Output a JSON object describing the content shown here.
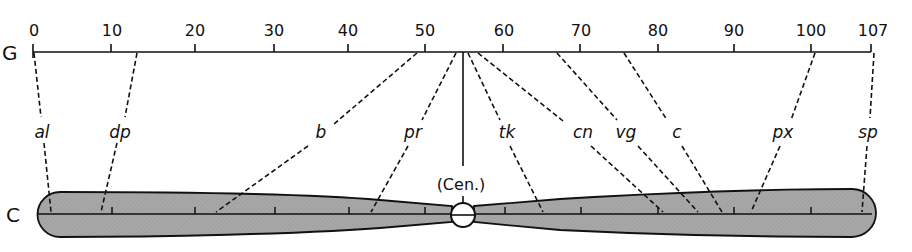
{
  "diagram": {
    "type": "genetic-vs-cytological-map",
    "genetic_map": {
      "label": "G",
      "range": [
        0,
        107
      ],
      "tick_labels": [
        "0",
        "10",
        "20",
        "30",
        "40",
        "50",
        "60",
        "70",
        "80",
        "90",
        "100",
        "107"
      ],
      "tick_values": [
        0,
        10,
        20,
        30,
        40,
        50,
        60,
        70,
        80,
        90,
        100,
        107
      ]
    },
    "chromosome": {
      "label": "C",
      "centromere_label": "(Cen.)",
      "fill_color": "#a9a9a9",
      "outline_color": "#111111"
    },
    "genes": [
      {
        "symbol": "al",
        "genetic_position": 0
      },
      {
        "symbol": "dp",
        "genetic_position": 13
      },
      {
        "symbol": "b",
        "genetic_position": 48.5
      },
      {
        "symbol": "pr",
        "genetic_position": 54.5
      },
      {
        "symbol": "tk",
        "genetic_position": 55.9
      },
      {
        "symbol": "cn",
        "genetic_position": 57.5
      },
      {
        "symbol": "vg",
        "genetic_position": 67
      },
      {
        "symbol": "c",
        "genetic_position": 75.5
      },
      {
        "symbol": "px",
        "genetic_position": 100.5
      },
      {
        "symbol": "sp",
        "genetic_position": 107
      }
    ]
  }
}
